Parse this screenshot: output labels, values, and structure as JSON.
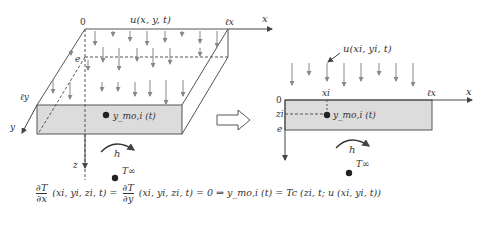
{
  "left_diagram": {
    "origin_label": "0",
    "field_label": "u(x, y, t)",
    "lx_label": "ℓx",
    "ly_label": "ℓy",
    "x_axis_label": "x",
    "y_axis_label": "y",
    "z_axis_label": "z",
    "thickness_label": "e",
    "measure_label": "y_mo,i (t)",
    "h_label": "h",
    "tinf_label": "T∞"
  },
  "transition_arrow": "hollow-right-arrow",
  "right_diagram": {
    "field_label": "u(xi, yi, t)",
    "origin_label": "0",
    "xi_label": "xi",
    "zi_label": "zi",
    "e_label": "e",
    "lx_label": "ℓx",
    "x_axis_label": "x",
    "measure_label": "y_mo,i (t)",
    "h_label": "h",
    "tinf_label": "T∞"
  },
  "equation": {
    "dT": "∂T",
    "dx": "∂x",
    "dy": "∂y",
    "args1": "(xi, yi, zi, t) =",
    "args2": "(xi, yi, zi, t) = 0  ⇒",
    "rhs": "y_mo,i (t) = Tc (zi, t; u (xi, yi, t))"
  },
  "colors": {
    "line": "#444444",
    "arrow": "#777777",
    "face_fill": "#dddddd"
  }
}
